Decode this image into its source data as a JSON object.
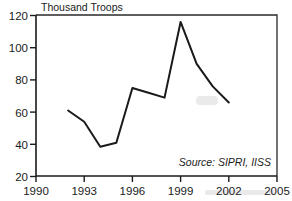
{
  "chart_data": {
    "type": "line",
    "title": "Thousand Troops",
    "xlabel": "",
    "ylabel": "Thousand Troops",
    "xlim": [
      1990,
      2005
    ],
    "ylim": [
      20,
      120
    ],
    "grid": false,
    "legend": null,
    "annotations": [
      {
        "name": "source-note",
        "text": "Source: SIPRI, IISS"
      }
    ],
    "x_ticks": [
      "1990",
      "1993",
      "1996",
      "1999",
      "2002",
      "2005"
    ],
    "x_tick_values": [
      1990,
      1993,
      1996,
      1999,
      2002,
      2005
    ],
    "y_ticks": [
      "20",
      "40",
      "60",
      "80",
      "100",
      "120"
    ],
    "y_tick_values": [
      20,
      40,
      60,
      80,
      100,
      120
    ],
    "series": [
      {
        "name": "Troops",
        "x": [
          1992,
          1993,
          1994,
          1995,
          1996,
          1997,
          1998,
          1999,
          2000,
          2001,
          2002
        ],
        "values": [
          61,
          54,
          38.5,
          41,
          75,
          72,
          69,
          116,
          90,
          76,
          66
        ]
      }
    ]
  },
  "axes": {
    "y_title": "Thousand Troops",
    "y_tick_labels": [
      "120",
      "100",
      "80",
      "60",
      "40",
      "20"
    ],
    "x_tick_labels": [
      "1990",
      "1993",
      "1996",
      "1999",
      "2002",
      "2005"
    ]
  },
  "footer": {
    "source": "Source: SIPRI, IISS"
  },
  "colors": {
    "line": "#1a1a1a",
    "axis": "#1b1b1b",
    "frame": "#2a2a2a",
    "background": "#ffffff",
    "text": "#1b1b1b"
  }
}
